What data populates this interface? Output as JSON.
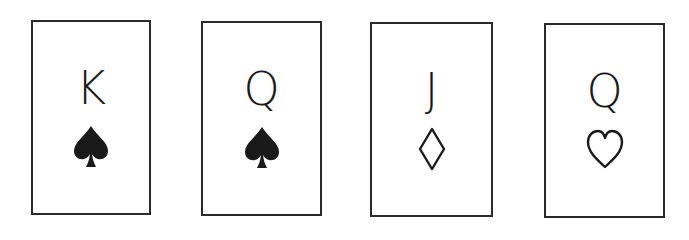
{
  "cards": [
    {
      "rank": "K",
      "suit": "spade",
      "suit_style": "filled",
      "color": "#1a1a1a"
    },
    {
      "rank": "Q",
      "suit": "spade",
      "suit_style": "filled",
      "color": "#1a1a1a"
    },
    {
      "rank": "J",
      "suit": "diamond",
      "suit_style": "outline",
      "color": "#1a1a1a"
    },
    {
      "rank": "Q",
      "suit": "heart",
      "suit_style": "outline",
      "color": "#1a1a1a"
    }
  ]
}
